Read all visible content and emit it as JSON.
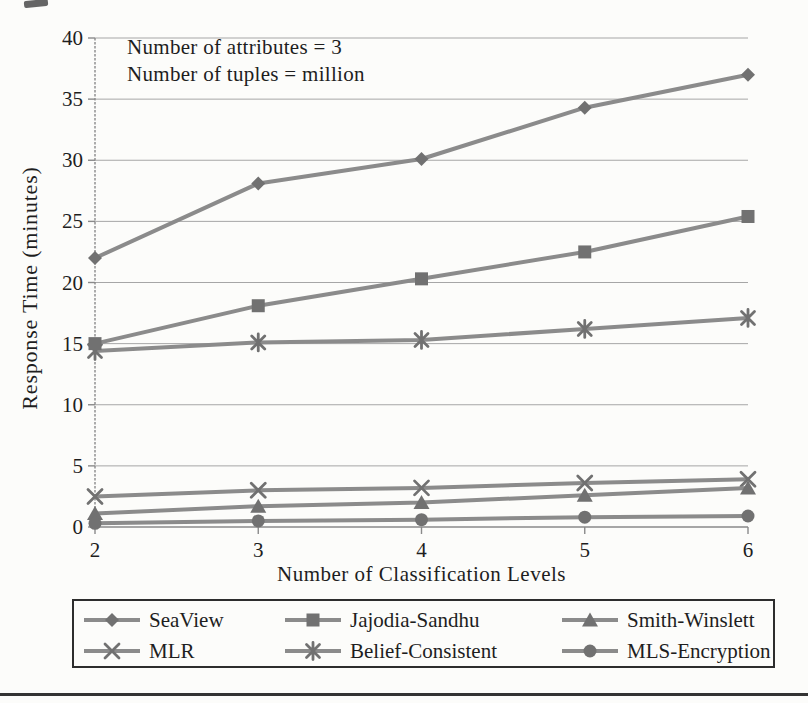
{
  "chart_data": {
    "type": "line",
    "x": [
      2,
      3,
      4,
      5,
      6
    ],
    "xlabel": "Number of Classification Levels",
    "ylabel": "Response Time (minutes)",
    "ylim": [
      0,
      40
    ],
    "y_ticks": [
      0,
      5,
      10,
      15,
      20,
      25,
      30,
      35,
      40
    ],
    "grid": "horizontal",
    "legend_position": "bottom",
    "annotations": [
      "Number of attributes = 3",
      "Number of tuples = million"
    ],
    "series": [
      {
        "name": "SeaView",
        "marker": "diamond",
        "values": [
          22.0,
          28.1,
          30.1,
          34.3,
          37.0
        ]
      },
      {
        "name": "Belief-Consistent",
        "marker": "asterisk",
        "values": [
          14.4,
          15.1,
          15.3,
          16.2,
          17.1
        ]
      },
      {
        "name": "Jajodia-Sandhu",
        "marker": "square",
        "values": [
          15.0,
          18.1,
          20.3,
          22.5,
          25.4
        ]
      },
      {
        "name": "MLR",
        "marker": "x",
        "values": [
          2.5,
          3.0,
          3.2,
          3.6,
          3.9
        ]
      },
      {
        "name": "Smith-Winslett",
        "marker": "triangle",
        "values": [
          1.1,
          1.7,
          2.0,
          2.6,
          3.2
        ]
      },
      {
        "name": "MLS-Encryption",
        "marker": "circle",
        "values": [
          0.3,
          0.5,
          0.6,
          0.8,
          0.9
        ]
      }
    ],
    "colors": {
      "line": "#8b8b8b",
      "marker": "#717171",
      "grid": "#a6a6a6",
      "axis": "#8a8a8a",
      "text": "#1e1e1e"
    }
  },
  "legend": {
    "items": [
      {
        "label": "SeaView",
        "marker": "diamond"
      },
      {
        "label": "Jajodia-Sandhu",
        "marker": "square"
      },
      {
        "label": "Smith-Winslett",
        "marker": "triangle"
      },
      {
        "label": "MLR",
        "marker": "x"
      },
      {
        "label": "Belief-Consistent",
        "marker": "asterisk"
      },
      {
        "label": "MLS-Encryption",
        "marker": "circle"
      }
    ]
  }
}
